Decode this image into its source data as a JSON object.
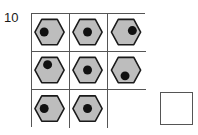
{
  "item": {
    "number": "10",
    "type": "matrix-reasoning-puzzle"
  },
  "style": {
    "hexagon_fill": "#bdbdbd",
    "hexagon_stroke": "#1a1a1a",
    "dot_fill": "#111111",
    "grid_line": "#555555",
    "cell_background": "#ffffff",
    "page_background": "#ffffff"
  },
  "matrix": {
    "rows": 3,
    "columns": 3,
    "cells": [
      {
        "id": "cell-r1c1",
        "row": 1,
        "col": 1,
        "empty": false,
        "shape": "hexagon",
        "dot": true,
        "dot_position": "left"
      },
      {
        "id": "cell-r1c2",
        "row": 1,
        "col": 2,
        "empty": false,
        "shape": "hexagon",
        "dot": true,
        "dot_position": "center"
      },
      {
        "id": "cell-r1c3",
        "row": 1,
        "col": 3,
        "empty": false,
        "shape": "hexagon",
        "dot": true,
        "dot_position": "right"
      },
      {
        "id": "cell-r2c1",
        "row": 2,
        "col": 1,
        "empty": false,
        "shape": "hexagon",
        "dot": true,
        "dot_position": "top-left"
      },
      {
        "id": "cell-r2c2",
        "row": 2,
        "col": 2,
        "empty": false,
        "shape": "hexagon",
        "dot": true,
        "dot_position": "center"
      },
      {
        "id": "cell-r2c3",
        "row": 2,
        "col": 3,
        "empty": false,
        "shape": "hexagon",
        "dot": true,
        "dot_position": "bottom-left"
      },
      {
        "id": "cell-r3c1",
        "row": 3,
        "col": 1,
        "empty": false,
        "shape": "hexagon",
        "dot": true,
        "dot_position": "left"
      },
      {
        "id": "cell-r3c2",
        "row": 3,
        "col": 2,
        "empty": false,
        "shape": "hexagon",
        "dot": true,
        "dot_position": "center"
      },
      {
        "id": "cell-r3c3",
        "row": 3,
        "col": 3,
        "empty": true,
        "shape": "none",
        "dot": false,
        "dot_position": "none"
      }
    ]
  },
  "answer_slot": {
    "label": "",
    "empty": true
  }
}
